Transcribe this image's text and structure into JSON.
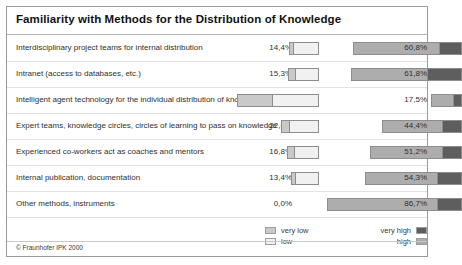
{
  "title": "Familiarity with Methods for the Distribution of Knowledge",
  "footer": {
    "copyright": "© Fraunhofer IPK 2000"
  },
  "legend": {
    "items": [
      {
        "key": "very_low",
        "label": "very low",
        "color": "#c9c9c9",
        "side": "left"
      },
      {
        "key": "low",
        "label": "low",
        "color": "#f1f1f1",
        "side": "left"
      },
      {
        "key": "very_high",
        "label": "very high",
        "color": "#5e5e5e",
        "side": "right"
      },
      {
        "key": "high",
        "label": "high",
        "color": "#adadad",
        "side": "right"
      }
    ]
  },
  "chart_data": {
    "type": "bar",
    "title": "Familiarity with Methods for the Distribution of Knowledge",
    "subtype": "diverging-stacked-bar",
    "xlabel": "",
    "ylabel": "",
    "grid": false,
    "legend_position": "bottom",
    "series": [
      {
        "name": "very low",
        "color": "#c9c9c9",
        "side": "left"
      },
      {
        "name": "low",
        "color": "#f1f1f1",
        "side": "left"
      },
      {
        "name": "high",
        "color": "#adadad",
        "side": "right"
      },
      {
        "name": "very high",
        "color": "#5e5e5e",
        "side": "right"
      }
    ],
    "categories": [
      "Interdisciplinary project teams for internal distribution",
      "Intranet (access to databases, etc.)",
      "Intelligent agent technology for the individual distribution of knowledge",
      "Expert teams, knowledge circles, circles of learning to pass on knowledge",
      "Experienced co-workers act as coaches and mentors",
      "Internal publication, documentation",
      "Other methods, instruments"
    ],
    "left_totals": [
      14.4,
      15.3,
      64.9,
      22.6,
      16.8,
      13.4,
      0.0
    ],
    "right_totals": [
      60.8,
      61.8,
      17.5,
      44.4,
      51.2,
      54.3,
      86.7
    ],
    "left_labels": [
      "14,4%",
      "15,3%",
      "64,9%",
      "22,6%",
      "16,8%",
      "13,4%",
      "0,0%"
    ],
    "right_labels": [
      "60,8%",
      "61,8%",
      "17,5%",
      "44,4%",
      "51,2%",
      "54,3%",
      "86,7%"
    ],
    "left_split": [
      {
        "very_low": 1.5,
        "low": 12.9
      },
      {
        "very_low": 3.5,
        "low": 11.8
      },
      {
        "very_low": 30.0,
        "low": 34.9
      },
      {
        "very_low": 4.0,
        "low": 18.6
      },
      {
        "very_low": 3.5,
        "low": 13.3
      },
      {
        "very_low": 1.5,
        "low": 11.9
      },
      {
        "very_low": 0.0,
        "low": 0.0
      }
    ],
    "right_split": [
      {
        "high": 48.0,
        "very_high": 12.8
      },
      {
        "high": 42.0,
        "very_high": 19.8
      },
      {
        "high": 12.5,
        "very_high": 5.0
      },
      {
        "high": 33.0,
        "very_high": 11.4
      },
      {
        "high": 40.0,
        "very_high": 11.2
      },
      {
        "high": 40.0,
        "very_high": 14.3
      },
      {
        "high": 70.0,
        "very_high": 16.7
      }
    ]
  },
  "rows": [
    {
      "label": "Interdisciplinary project teams for internal distribution",
      "left_value": "14,4%",
      "right_value": "60,8%",
      "left_px": 30,
      "right_px": 109,
      "left_segments": [
        {
          "cls": "seg-verylow",
          "px": 4
        },
        {
          "cls": "seg-low",
          "px": 26
        }
      ],
      "right_segments": [
        {
          "cls": "seg-high",
          "px": 86
        },
        {
          "cls": "seg-veryhigh",
          "px": 23
        }
      ]
    },
    {
      "label": "Intranet (access to databases, etc.)",
      "left_value": "15,3%",
      "right_value": "61,8%",
      "left_px": 31,
      "right_px": 111,
      "left_segments": [
        {
          "cls": "seg-verylow",
          "px": 7
        },
        {
          "cls": "seg-low",
          "px": 24
        }
      ],
      "right_segments": [
        {
          "cls": "seg-high",
          "px": 76
        },
        {
          "cls": "seg-veryhigh",
          "px": 35
        }
      ]
    },
    {
      "label": "Intelligent agent technology for the individual distribution of knowledge",
      "left_value": "64,9%",
      "right_value": "17,5%",
      "left_px": 82,
      "right_px": 31,
      "left_segments": [
        {
          "cls": "seg-verylow",
          "px": 35
        },
        {
          "cls": "seg-low",
          "px": 47
        }
      ],
      "right_segments": [
        {
          "cls": "seg-high",
          "px": 22
        },
        {
          "cls": "seg-veryhigh",
          "px": 9
        }
      ]
    },
    {
      "label": "Expert teams, knowledge circles, circles of learning to pass on knowledge",
      "left_value": "22,6%",
      "right_value": "44,4%",
      "left_px": 38,
      "right_px": 80,
      "left_segments": [
        {
          "cls": "seg-verylow",
          "px": 8
        },
        {
          "cls": "seg-low",
          "px": 30
        }
      ],
      "right_segments": [
        {
          "cls": "seg-high",
          "px": 60
        },
        {
          "cls": "seg-veryhigh",
          "px": 20
        }
      ]
    },
    {
      "label": "Experienced co-workers act as coaches and mentors",
      "left_value": "16,8%",
      "right_value": "51,2%",
      "left_px": 32,
      "right_px": 92,
      "left_segments": [
        {
          "cls": "seg-verylow",
          "px": 7
        },
        {
          "cls": "seg-low",
          "px": 25
        }
      ],
      "right_segments": [
        {
          "cls": "seg-high",
          "px": 72
        },
        {
          "cls": "seg-veryhigh",
          "px": 20
        }
      ]
    },
    {
      "label": "Internal publication, documentation",
      "left_value": "13,4%",
      "right_value": "54,3%",
      "left_px": 28,
      "right_px": 97,
      "left_segments": [
        {
          "cls": "seg-verylow",
          "px": 4
        },
        {
          "cls": "seg-low",
          "px": 24
        }
      ],
      "right_segments": [
        {
          "cls": "seg-high",
          "px": 72
        },
        {
          "cls": "seg-veryhigh",
          "px": 25
        }
      ]
    },
    {
      "label": "Other methods, instruments",
      "left_value": "0,0%",
      "right_value": "86,7%",
      "left_px": 0,
      "right_px": 135,
      "left_segments": [],
      "right_segments": [
        {
          "cls": "seg-high",
          "px": 110
        },
        {
          "cls": "seg-veryhigh",
          "px": 25
        }
      ]
    }
  ]
}
